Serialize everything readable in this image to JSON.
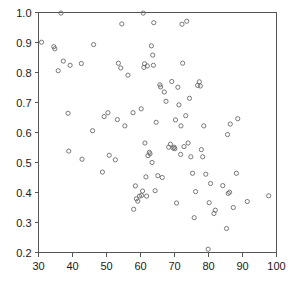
{
  "chart_data": {
    "type": "scatter",
    "title": "",
    "subtitle": "",
    "xlabel": "",
    "ylabel": "",
    "xlim": [
      30,
      100
    ],
    "ylim": [
      0.2,
      1.0
    ],
    "grid": false,
    "legend": null,
    "marker": "open-circle",
    "marker_color": "#6b6b6b",
    "xticks": [
      30,
      40,
      50,
      60,
      70,
      80,
      90,
      100
    ],
    "xtick_labels": [
      "30",
      "40",
      "50",
      "60",
      "70",
      "80",
      "90",
      "100"
    ],
    "yticks": [
      0.2,
      0.3,
      0.4,
      0.5,
      0.6,
      0.7,
      0.8,
      0.9,
      1.0
    ],
    "ytick_labels": [
      "0.2",
      "0.3",
      "0.4",
      "0.5",
      "0.6",
      "0.7",
      "0.8",
      "0.9",
      "1.0"
    ],
    "points": [
      [
        30.9,
        0.901
      ],
      [
        34.5,
        0.886
      ],
      [
        34.8,
        0.879
      ],
      [
        35.8,
        0.806
      ],
      [
        36.6,
        0.998
      ],
      [
        37.3,
        0.838
      ],
      [
        38.7,
        0.664
      ],
      [
        38.9,
        0.538
      ],
      [
        39.3,
        0.824
      ],
      [
        42.6,
        0.83
      ],
      [
        42.8,
        0.511
      ],
      [
        45.9,
        0.606
      ],
      [
        46.2,
        0.893
      ],
      [
        48.8,
        0.468
      ],
      [
        49.3,
        0.653
      ],
      [
        50.4,
        0.666
      ],
      [
        50.8,
        0.524
      ],
      [
        52.6,
        0.509
      ],
      [
        53.2,
        0.643
      ],
      [
        53.5,
        0.831
      ],
      [
        54.2,
        0.815
      ],
      [
        54.5,
        0.962
      ],
      [
        55.4,
        0.622
      ],
      [
        56.3,
        0.791
      ],
      [
        57.8,
        0.666
      ],
      [
        58.0,
        0.344
      ],
      [
        58.5,
        0.422
      ],
      [
        58.8,
        0.379
      ],
      [
        59.2,
        0.371
      ],
      [
        59.7,
        0.388
      ],
      [
        60.2,
        0.679
      ],
      [
        60.3,
        0.39
      ],
      [
        60.6,
        0.405
      ],
      [
        60.8,
        0.998
      ],
      [
        61.0,
        0.817
      ],
      [
        61.2,
        0.829
      ],
      [
        61.3,
        0.565
      ],
      [
        61.6,
        0.452
      ],
      [
        61.8,
        0.388
      ],
      [
        62.0,
        0.822
      ],
      [
        62.2,
        0.523
      ],
      [
        62.6,
        0.534
      ],
      [
        62.8,
        0.529
      ],
      [
        63.2,
        0.889
      ],
      [
        63.4,
        0.5
      ],
      [
        63.6,
        0.858
      ],
      [
        63.8,
        0.824
      ],
      [
        63.9,
        0.966
      ],
      [
        64.3,
        0.406
      ],
      [
        64.6,
        0.634
      ],
      [
        65.1,
        0.456
      ],
      [
        65.7,
        0.759
      ],
      [
        65.9,
        0.752
      ],
      [
        66.4,
        0.45
      ],
      [
        67.0,
        0.735
      ],
      [
        67.5,
        0.704
      ],
      [
        68.3,
        0.551
      ],
      [
        68.8,
        0.561
      ],
      [
        69.2,
        0.77
      ],
      [
        69.6,
        0.548
      ],
      [
        69.9,
        0.551
      ],
      [
        70.1,
        0.546
      ],
      [
        70.3,
        0.642
      ],
      [
        70.6,
        0.365
      ],
      [
        71.0,
        0.751
      ],
      [
        71.3,
        0.692
      ],
      [
        71.8,
        0.527
      ],
      [
        71.9,
        0.622
      ],
      [
        72.2,
        0.961
      ],
      [
        72.4,
        0.831
      ],
      [
        72.8,
        0.553
      ],
      [
        73.3,
        0.656
      ],
      [
        73.6,
        0.971
      ],
      [
        74.0,
        0.565
      ],
      [
        74.4,
        0.714
      ],
      [
        74.8,
        0.519
      ],
      [
        75.3,
        0.464
      ],
      [
        75.8,
        0.316
      ],
      [
        76.2,
        0.403
      ],
      [
        76.8,
        0.757
      ],
      [
        77.3,
        0.769
      ],
      [
        77.6,
        0.755
      ],
      [
        77.9,
        0.543
      ],
      [
        78.3,
        0.519
      ],
      [
        78.6,
        0.622
      ],
      [
        79.2,
        0.461
      ],
      [
        79.9,
        0.211
      ],
      [
        80.2,
        0.366
      ],
      [
        80.6,
        0.43
      ],
      [
        81.6,
        0.33
      ],
      [
        82.0,
        0.341
      ],
      [
        84.2,
        0.423
      ],
      [
        85.3,
        0.28
      ],
      [
        85.6,
        0.593
      ],
      [
        85.8,
        0.397
      ],
      [
        86.2,
        0.401
      ],
      [
        86.4,
        0.628
      ],
      [
        87.3,
        0.35
      ],
      [
        88.2,
        0.464
      ],
      [
        88.6,
        0.646
      ],
      [
        91.4,
        0.37
      ],
      [
        97.7,
        0.389
      ]
    ]
  }
}
